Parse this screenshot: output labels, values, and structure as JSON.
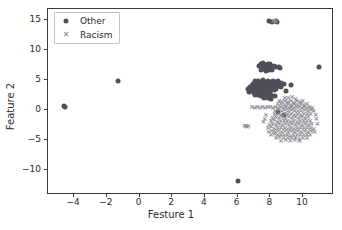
{
  "chart_data": {
    "type": "scatter",
    "title": "",
    "xlabel": "Festure 1",
    "ylabel": "Feature 2",
    "xlim": [
      -5.6,
      11.9
    ],
    "ylim": [
      -14.2,
      16.8
    ],
    "xticks": [
      -4,
      -2,
      0,
      2,
      4,
      6,
      8,
      10
    ],
    "yticks": [
      -10,
      -5,
      0,
      5,
      10,
      15
    ],
    "xticklabels": [
      "−4",
      "−2",
      "0",
      "2",
      "4",
      "6",
      "8",
      "10"
    ],
    "yticklabels": [
      "−10",
      "−5",
      "0",
      "5",
      "10",
      "15"
    ],
    "grid": false,
    "legend_position": "upper left",
    "colors": {
      "other": "#4f4f5a",
      "racism": "#8c8c96",
      "frame": "#3a3a3a"
    },
    "series": [
      {
        "name": "Other",
        "marker": "circle",
        "color": "#4f4f5a",
        "points": [
          [
            -4.62,
            0.6
          ],
          [
            -4.58,
            0.52
          ],
          [
            -1.32,
            4.72
          ],
          [
            6.05,
            -11.82
          ],
          [
            10.98,
            7.18
          ],
          [
            7.95,
            14.74
          ],
          [
            8.12,
            14.7
          ],
          [
            8.38,
            14.8
          ],
          [
            8.42,
            14.62
          ],
          [
            7.44,
            7.62
          ],
          [
            7.58,
            7.72
          ],
          [
            7.7,
            7.48
          ],
          [
            7.86,
            7.58
          ],
          [
            7.98,
            7.7
          ],
          [
            7.5,
            7.12
          ],
          [
            7.64,
            7.2
          ],
          [
            7.8,
            7.02
          ],
          [
            7.94,
            7.24
          ],
          [
            8.08,
            7.1
          ],
          [
            8.22,
            7.28
          ],
          [
            8.36,
            7.08
          ],
          [
            8.52,
            7.18
          ],
          [
            7.32,
            7.3
          ],
          [
            8.62,
            7.02
          ],
          [
            7.42,
            6.66
          ],
          [
            7.6,
            6.72
          ],
          [
            7.76,
            6.54
          ],
          [
            7.92,
            6.68
          ],
          [
            8.1,
            6.58
          ],
          [
            7.06,
            4.72
          ],
          [
            7.22,
            4.86
          ],
          [
            7.38,
            4.64
          ],
          [
            7.54,
            4.9
          ],
          [
            7.7,
            4.7
          ],
          [
            7.86,
            4.84
          ],
          [
            8.02,
            4.62
          ],
          [
            8.18,
            4.88
          ],
          [
            8.34,
            4.66
          ],
          [
            8.5,
            4.8
          ],
          [
            6.92,
            4.3
          ],
          [
            7.08,
            4.42
          ],
          [
            7.24,
            4.22
          ],
          [
            7.4,
            4.46
          ],
          [
            7.56,
            4.26
          ],
          [
            7.72,
            4.4
          ],
          [
            7.88,
            4.18
          ],
          [
            8.04,
            4.44
          ],
          [
            8.2,
            4.24
          ],
          [
            8.36,
            4.38
          ],
          [
            8.52,
            4.2
          ],
          [
            8.68,
            4.42
          ],
          [
            8.84,
            4.26
          ],
          [
            6.74,
            3.86
          ],
          [
            6.9,
            3.98
          ],
          [
            7.06,
            3.78
          ],
          [
            7.22,
            4.02
          ],
          [
            7.38,
            3.82
          ],
          [
            7.54,
            3.96
          ],
          [
            7.7,
            3.74
          ],
          [
            7.86,
            4.0
          ],
          [
            8.02,
            3.8
          ],
          [
            8.18,
            3.94
          ],
          [
            8.34,
            3.76
          ],
          [
            8.5,
            3.98
          ],
          [
            8.66,
            3.84
          ],
          [
            6.62,
            3.4
          ],
          [
            6.78,
            3.52
          ],
          [
            6.94,
            3.32
          ],
          [
            7.1,
            3.56
          ],
          [
            7.26,
            3.36
          ],
          [
            7.42,
            3.5
          ],
          [
            7.58,
            3.28
          ],
          [
            7.74,
            3.54
          ],
          [
            7.9,
            3.34
          ],
          [
            8.06,
            3.48
          ],
          [
            8.22,
            3.3
          ],
          [
            8.38,
            3.52
          ],
          [
            6.7,
            2.94
          ],
          [
            6.86,
            3.06
          ],
          [
            7.02,
            2.86
          ],
          [
            7.18,
            3.1
          ],
          [
            7.34,
            2.9
          ],
          [
            7.5,
            3.04
          ],
          [
            7.66,
            2.82
          ],
          [
            7.82,
            3.08
          ],
          [
            7.98,
            2.88
          ],
          [
            7.06,
            2.4
          ],
          [
            7.26,
            2.52
          ],
          [
            7.46,
            2.32
          ],
          [
            7.66,
            2.56
          ],
          [
            7.86,
            2.36
          ],
          [
            8.06,
            2.5
          ],
          [
            8.26,
            2.28
          ],
          [
            7.62,
            1.92
          ],
          [
            7.84,
            2.04
          ],
          [
            8.06,
            1.84
          ],
          [
            9.24,
            4.18
          ],
          [
            8.98,
            3.12
          ],
          [
            8.86,
            -0.92
          ],
          [
            8.46,
            -0.4
          ]
        ]
      },
      {
        "name": "Racism",
        "marker": "x",
        "color": "#8c8c96",
        "points": [
          [
            6.42,
            -2.78
          ],
          [
            6.58,
            -2.86
          ],
          [
            6.52,
            -2.64
          ],
          [
            6.66,
            -2.74
          ],
          [
            8.18,
            14.72
          ],
          [
            8.3,
            14.86
          ],
          [
            8.34,
            14.58
          ],
          [
            6.88,
            0.42
          ],
          [
            7.04,
            0.34
          ],
          [
            7.2,
            0.46
          ],
          [
            7.36,
            0.3
          ],
          [
            7.52,
            0.44
          ],
          [
            7.68,
            0.28
          ],
          [
            7.84,
            0.4
          ],
          [
            8.0,
            0.5
          ],
          [
            8.16,
            0.32
          ],
          [
            8.32,
            0.46
          ],
          [
            8.48,
            0.28
          ],
          [
            8.64,
            0.42
          ],
          [
            8.8,
            0.34
          ],
          [
            8.96,
            0.48
          ],
          [
            9.12,
            0.3
          ],
          [
            9.28,
            0.44
          ],
          [
            9.44,
            0.26
          ],
          [
            9.6,
            0.4
          ],
          [
            9.76,
            0.52
          ],
          [
            9.92,
            0.32
          ],
          [
            10.08,
            0.46
          ],
          [
            10.24,
            0.28
          ],
          [
            10.4,
            0.42
          ],
          [
            10.56,
            0.34
          ],
          [
            8.54,
            1.42
          ],
          [
            8.72,
            1.3
          ],
          [
            8.9,
            1.48
          ],
          [
            9.08,
            1.24
          ],
          [
            9.26,
            1.44
          ],
          [
            9.44,
            1.18
          ],
          [
            9.62,
            1.4
          ],
          [
            9.8,
            1.26
          ],
          [
            9.98,
            1.46
          ],
          [
            8.88,
            2.04
          ],
          [
            9.1,
            1.9
          ],
          [
            9.32,
            2.1
          ],
          [
            9.54,
            1.88
          ],
          [
            8.46,
            0.92
          ],
          [
            8.66,
            1.0
          ],
          [
            8.86,
            0.84
          ],
          [
            9.06,
            1.02
          ],
          [
            9.26,
            0.86
          ],
          [
            9.46,
            0.98
          ],
          [
            9.66,
            0.82
          ],
          [
            9.86,
            1.0
          ],
          [
            10.06,
            0.88
          ],
          [
            10.26,
            0.96
          ],
          [
            8.3,
            -0.18
          ],
          [
            8.5,
            -0.06
          ],
          [
            8.7,
            -0.24
          ],
          [
            8.9,
            -0.1
          ],
          [
            9.1,
            -0.22
          ],
          [
            9.3,
            -0.08
          ],
          [
            9.5,
            -0.26
          ],
          [
            9.7,
            -0.12
          ],
          [
            9.9,
            -0.24
          ],
          [
            10.1,
            -0.08
          ],
          [
            10.3,
            -0.2
          ],
          [
            10.5,
            -0.1
          ],
          [
            10.66,
            -0.26
          ],
          [
            8.26,
            -0.74
          ],
          [
            8.46,
            -0.62
          ],
          [
            8.66,
            -0.8
          ],
          [
            8.86,
            -0.66
          ],
          [
            9.06,
            -0.78
          ],
          [
            9.26,
            -0.64
          ],
          [
            9.46,
            -0.82
          ],
          [
            9.66,
            -0.68
          ],
          [
            9.86,
            -0.8
          ],
          [
            10.06,
            -0.66
          ],
          [
            10.26,
            -0.78
          ],
          [
            10.46,
            -0.64
          ],
          [
            8.12,
            -1.32
          ],
          [
            8.32,
            -1.2
          ],
          [
            8.52,
            -1.38
          ],
          [
            8.72,
            -1.24
          ],
          [
            8.92,
            -1.36
          ],
          [
            9.12,
            -1.22
          ],
          [
            9.32,
            -1.4
          ],
          [
            9.52,
            -1.26
          ],
          [
            9.72,
            -1.38
          ],
          [
            9.92,
            -1.24
          ],
          [
            10.12,
            -1.36
          ],
          [
            10.32,
            -1.22
          ],
          [
            8.04,
            -1.9
          ],
          [
            8.24,
            -1.78
          ],
          [
            8.44,
            -1.96
          ],
          [
            8.64,
            -1.82
          ],
          [
            8.84,
            -1.94
          ],
          [
            9.04,
            -1.8
          ],
          [
            9.24,
            -1.98
          ],
          [
            9.44,
            -1.84
          ],
          [
            9.64,
            -1.96
          ],
          [
            9.84,
            -1.82
          ],
          [
            10.04,
            -1.94
          ],
          [
            10.24,
            -1.8
          ],
          [
            10.44,
            -1.92
          ],
          [
            7.94,
            -2.48
          ],
          [
            8.14,
            -2.36
          ],
          [
            8.34,
            -2.54
          ],
          [
            8.54,
            -2.4
          ],
          [
            8.74,
            -2.52
          ],
          [
            8.94,
            -2.38
          ],
          [
            9.14,
            -2.56
          ],
          [
            9.34,
            -2.42
          ],
          [
            9.54,
            -2.54
          ],
          [
            9.74,
            -2.4
          ],
          [
            9.94,
            -2.52
          ],
          [
            10.14,
            -2.38
          ],
          [
            10.34,
            -2.5
          ],
          [
            10.54,
            -2.44
          ],
          [
            7.86,
            -3.06
          ],
          [
            8.06,
            -2.94
          ],
          [
            8.26,
            -3.12
          ],
          [
            8.46,
            -2.98
          ],
          [
            8.66,
            -3.1
          ],
          [
            8.86,
            -2.96
          ],
          [
            9.06,
            -3.14
          ],
          [
            9.26,
            -3.0
          ],
          [
            9.46,
            -3.12
          ],
          [
            9.66,
            -2.98
          ],
          [
            9.86,
            -3.1
          ],
          [
            10.06,
            -2.96
          ],
          [
            10.26,
            -3.08
          ],
          [
            10.46,
            -3.02
          ],
          [
            10.66,
            -3.14
          ],
          [
            7.9,
            -3.64
          ],
          [
            8.1,
            -3.52
          ],
          [
            8.3,
            -3.7
          ],
          [
            8.5,
            -3.56
          ],
          [
            8.7,
            -3.68
          ],
          [
            8.9,
            -3.54
          ],
          [
            9.1,
            -3.72
          ],
          [
            9.3,
            -3.58
          ],
          [
            9.5,
            -3.7
          ],
          [
            9.7,
            -3.56
          ],
          [
            9.9,
            -3.68
          ],
          [
            10.1,
            -3.54
          ],
          [
            10.3,
            -3.66
          ],
          [
            10.5,
            -3.6
          ],
          [
            10.7,
            -3.72
          ],
          [
            8.04,
            -4.22
          ],
          [
            8.24,
            -4.1
          ],
          [
            8.44,
            -4.28
          ],
          [
            8.64,
            -4.14
          ],
          [
            8.84,
            -4.26
          ],
          [
            9.04,
            -4.12
          ],
          [
            9.24,
            -4.3
          ],
          [
            9.44,
            -4.16
          ],
          [
            9.64,
            -4.28
          ],
          [
            9.84,
            -4.14
          ],
          [
            10.04,
            -4.26
          ],
          [
            10.24,
            -4.12
          ],
          [
            10.44,
            -4.24
          ],
          [
            8.34,
            -4.72
          ],
          [
            8.58,
            -4.6
          ],
          [
            8.82,
            -4.78
          ],
          [
            9.06,
            -4.64
          ],
          [
            9.3,
            -4.76
          ],
          [
            9.54,
            -4.62
          ],
          [
            9.78,
            -4.8
          ],
          [
            10.02,
            -4.66
          ],
          [
            10.26,
            -4.74
          ],
          [
            8.66,
            -5.18
          ],
          [
            8.94,
            -5.06
          ],
          [
            9.22,
            -5.22
          ],
          [
            9.5,
            -5.08
          ],
          [
            9.78,
            -5.2
          ],
          [
            7.58,
            -2.1
          ],
          [
            7.66,
            -1.52
          ],
          [
            7.74,
            -0.92
          ],
          [
            10.82,
            -1.6
          ],
          [
            10.88,
            -2.3
          ],
          [
            10.78,
            -0.92
          ]
        ]
      }
    ]
  }
}
